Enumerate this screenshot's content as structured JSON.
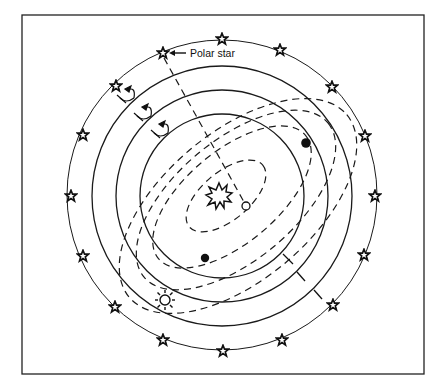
{
  "figure": {
    "type": "celestial-sphere-diagram",
    "labels": {
      "polar_star": "Polar star"
    },
    "center": {
      "x": 222,
      "y": 195
    },
    "colors": {
      "ink": "#1a1a1a",
      "background": "#ffffff"
    },
    "celestial_circle": {
      "radius": 154,
      "stars": [
        {
          "x": 222,
          "y": 39
        },
        {
          "x": 280,
          "y": 50
        },
        {
          "x": 332,
          "y": 87
        },
        {
          "x": 365,
          "y": 136
        },
        {
          "x": 375,
          "y": 196
        },
        {
          "x": 364,
          "y": 255
        },
        {
          "x": 333,
          "y": 305
        },
        {
          "x": 282,
          "y": 340
        },
        {
          "x": 223,
          "y": 351
        },
        {
          "x": 163,
          "y": 340
        },
        {
          "x": 115,
          "y": 307
        },
        {
          "x": 83,
          "y": 256
        },
        {
          "x": 71,
          "y": 196
        },
        {
          "x": 83,
          "y": 135
        },
        {
          "x": 116,
          "y": 86
        },
        {
          "x": 163,
          "y": 53,
          "role": "polar-star"
        }
      ]
    },
    "solid_circles": [
      {
        "r": 130
      },
      {
        "r": 106
      },
      {
        "r": 82
      }
    ],
    "dashed_orbits": [
      {
        "rx": 48,
        "ry": 24,
        "cx": 226,
        "cy": 196,
        "rotate": -40
      },
      {
        "rx": 95,
        "ry": 48,
        "cx": 232,
        "cy": 196,
        "rotate": -40
      },
      {
        "rx": 120,
        "ry": 62,
        "cx": 234,
        "cy": 200,
        "rotate": -40
      },
      {
        "rx": 140,
        "ry": 78,
        "cx": 238,
        "cy": 206,
        "rotate": -40
      }
    ],
    "bodies": [
      {
        "name": "central-burst",
        "x": 219,
        "y": 196
      },
      {
        "name": "open-circle",
        "x": 246,
        "y": 206,
        "r": 4
      },
      {
        "name": "filled-dot-upper-right",
        "x": 306,
        "y": 143,
        "r": 4.5
      },
      {
        "name": "filled-dot-lower-left",
        "x": 205,
        "y": 258,
        "r": 4
      },
      {
        "name": "sun",
        "x": 165,
        "y": 300
      }
    ],
    "rotation_arrows": 3,
    "tick_marks": 3
  }
}
